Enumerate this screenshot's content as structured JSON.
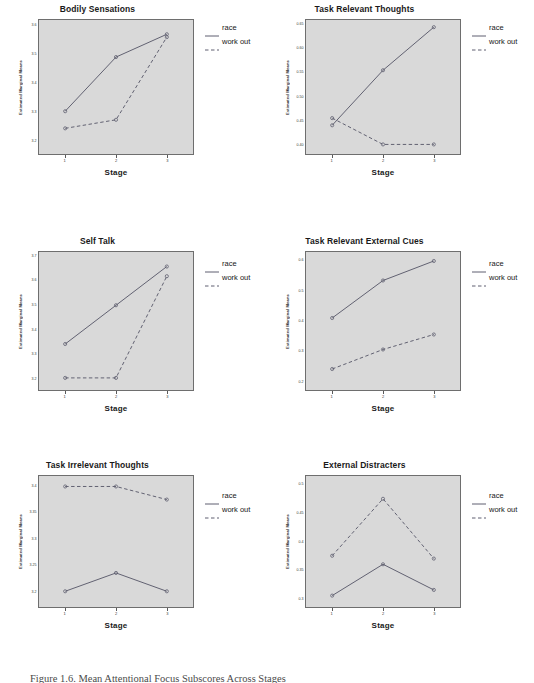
{
  "figure": {
    "caption": "Figure 1.6. Mean Attentional Focus Subscores Across Stages",
    "legend": [
      {
        "label": "race",
        "style": "solid",
        "color": "#5a5a6e"
      },
      {
        "label": "work out",
        "style": "dashed",
        "color": "#5a5a6e"
      }
    ],
    "xlabel": "Stage",
    "ylabel": "Estimated Marginal Means",
    "xticks": [
      "1",
      "2",
      "3"
    ],
    "plot_background": "#d9d9d9",
    "axis_color": "#6e6e6e"
  },
  "chart_data": [
    {
      "type": "line",
      "title": "Bodily Sensations",
      "xlabel": "Stage",
      "ylabel": "Estimated Marginal Means",
      "categories": [
        "1",
        "2",
        "3"
      ],
      "ylim": [
        3.15,
        3.62
      ],
      "yticks": [
        "3.6",
        "3.5",
        "3.4",
        "3.3",
        "3.2"
      ],
      "ytick_values": [
        3.6,
        3.5,
        3.4,
        3.3,
        3.2
      ],
      "grid": false,
      "legend_position": "right",
      "series": [
        {
          "name": "race",
          "style": "solid",
          "values": [
            3.3,
            3.49,
            3.57
          ]
        },
        {
          "name": "work out",
          "style": "dashed",
          "values": [
            3.24,
            3.27,
            3.56
          ]
        }
      ]
    },
    {
      "type": "line",
      "title": "Task Relevant Thoughts",
      "xlabel": "Stage",
      "ylabel": "Estimated Marginal Means",
      "categories": [
        "1",
        "2",
        "3"
      ],
      "ylim": [
        0.38,
        0.66
      ],
      "yticks": [
        "0.65",
        "0.60",
        "0.55",
        "0.50",
        "0.45",
        "0.40"
      ],
      "ytick_values": [
        0.65,
        0.6,
        0.55,
        0.5,
        0.45,
        0.4
      ],
      "grid": false,
      "legend_position": "right",
      "series": [
        {
          "name": "race",
          "style": "solid",
          "values": [
            0.44,
            0.555,
            0.645
          ]
        },
        {
          "name": "work out",
          "style": "dashed",
          "values": [
            0.455,
            0.4,
            0.4
          ]
        }
      ]
    },
    {
      "type": "line",
      "title": "Self Talk",
      "xlabel": "Stage",
      "ylabel": "Estimated Marginal Means",
      "categories": [
        "1",
        "2",
        "3"
      ],
      "ylim": [
        3.15,
        3.72
      ],
      "yticks": [
        "3.7",
        "3.6",
        "3.5",
        "3.4",
        "3.3",
        "3.2"
      ],
      "ytick_values": [
        3.7,
        3.6,
        3.5,
        3.4,
        3.3,
        3.2
      ],
      "grid": false,
      "legend_position": "right",
      "series": [
        {
          "name": "race",
          "style": "solid",
          "values": [
            3.34,
            3.5,
            3.66
          ]
        },
        {
          "name": "work out",
          "style": "dashed",
          "values": [
            3.2,
            3.2,
            3.62
          ]
        }
      ]
    },
    {
      "type": "line",
      "title": "Task Relevant External Cues",
      "xlabel": "Stage",
      "ylabel": "Estimated Marginal Means",
      "categories": [
        "1",
        "2",
        "3"
      ],
      "ylim": [
        0.17,
        0.63
      ],
      "yticks": [
        "0.6",
        "0.5",
        "0.4",
        "0.3",
        "0.2"
      ],
      "ytick_values": [
        0.6,
        0.5,
        0.4,
        0.3,
        0.2
      ],
      "grid": false,
      "legend_position": "right",
      "series": [
        {
          "name": "race",
          "style": "solid",
          "values": [
            0.41,
            0.535,
            0.6
          ]
        },
        {
          "name": "work out",
          "style": "dashed",
          "values": [
            0.24,
            0.305,
            0.355
          ]
        }
      ]
    },
    {
      "type": "line",
      "title": "Task Irrelevant Thoughts",
      "xlabel": "Stage",
      "ylabel": "Estimated Marginal Means",
      "categories": [
        "1",
        "2",
        "3"
      ],
      "ylim": [
        3.17,
        3.42
      ],
      "yticks": [
        "3.4",
        "3.35",
        "3.3",
        "3.25",
        "3.2"
      ],
      "ytick_values": [
        3.4,
        3.35,
        3.3,
        3.25,
        3.2
      ],
      "grid": false,
      "legend_position": "right",
      "series": [
        {
          "name": "race",
          "style": "solid",
          "values": [
            3.2,
            3.235,
            3.2
          ]
        },
        {
          "name": "work out",
          "style": "dashed",
          "values": [
            3.4,
            3.4,
            3.375
          ]
        }
      ]
    },
    {
      "type": "line",
      "title": "External Distracters",
      "xlabel": "Stage",
      "ylabel": "Estimated Marginal Means",
      "categories": [
        "1",
        "2",
        "3"
      ],
      "ylim": [
        0.285,
        0.515
      ],
      "yticks": [
        "0.5",
        "0.45",
        "0.4",
        "0.35",
        "0.3"
      ],
      "ytick_values": [
        0.5,
        0.45,
        0.4,
        0.35,
        0.3
      ],
      "grid": false,
      "legend_position": "right",
      "series": [
        {
          "name": "race",
          "style": "solid",
          "values": [
            0.305,
            0.36,
            0.315
          ]
        },
        {
          "name": "work out",
          "style": "dashed",
          "values": [
            0.375,
            0.475,
            0.37
          ]
        }
      ]
    }
  ]
}
